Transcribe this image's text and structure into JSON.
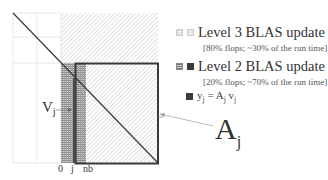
{
  "legend": {
    "items": [
      {
        "swatch_icons": [
          "light-grid-square-icon",
          "light-solid-square-icon"
        ],
        "title": "Level 3 BLAS update",
        "subtitle": "[80% flops; ~30% of the run time]"
      },
      {
        "swatch_icons": [
          "dark-grid-square-icon",
          "dark-solid-square-icon"
        ],
        "title": "Level 2 BLAS update",
        "subtitle": "[20% flops; ~70% of the run time]"
      }
    ],
    "equation": {
      "swatch_icon": "dark-solid-square-icon",
      "y": "y",
      "y_sub": "j",
      "eq": " = ",
      "A": "A",
      "A_sub": "j",
      "v": " v",
      "v_sub": "j"
    }
  },
  "labels": {
    "vj_main": "V",
    "vj_sub": "j",
    "aj_main": "A",
    "aj_sub": "j",
    "axis_0": "0",
    "axis_j": "j",
    "axis_nb": "nb"
  },
  "colors": {
    "border_dark": "#3a3a3a",
    "hatch_light": "#c8c8c8",
    "mesh": "#8a8a8a",
    "grid_line": "#e0e0e0",
    "diagonal": "#3a3a3a",
    "arrow": "#bbbbbb"
  }
}
